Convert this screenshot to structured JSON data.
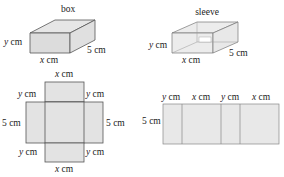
{
  "box": {
    "title": "box",
    "height_label_var": "y",
    "height_label_unit": " cm",
    "width_label_var": "x",
    "width_label_unit": " cm",
    "depth_label": "5 cm"
  },
  "sleeve": {
    "title": "sleeve",
    "height_label_var": "y",
    "height_label_unit": " cm",
    "width_label_var": "x",
    "width_label_unit": " cm",
    "depth_label": "5 cm"
  },
  "box_net": {
    "top_label_var": "x",
    "top_label_unit": " cm",
    "bottom_label_var": "x",
    "bottom_label_unit": " cm",
    "upper_left_var": "y",
    "upper_left_unit": " cm",
    "upper_right_var": "y",
    "upper_right_unit": " cm",
    "lower_left_var": "y",
    "lower_left_unit": " cm",
    "lower_right_var": "y",
    "lower_right_unit": " cm",
    "left_label": "5 cm",
    "right_label": "5 cm"
  },
  "sleeve_net": {
    "side_label": "5 cm",
    "segments": [
      {
        "var": "y",
        "unit": " cm"
      },
      {
        "var": "x",
        "unit": " cm"
      },
      {
        "var": "y",
        "unit": " cm"
      },
      {
        "var": "x",
        "unit": " cm"
      }
    ]
  },
  "colors": {
    "fill": "#e3e3e3",
    "stroke": "#555555"
  }
}
